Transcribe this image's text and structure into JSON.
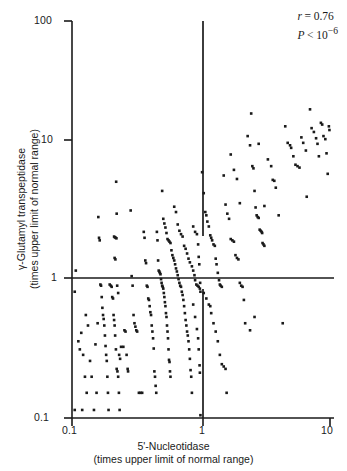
{
  "chart_data": {
    "type": "scatter",
    "title": "",
    "xlabel": "5'-Nucleotidase",
    "xlabel_sub": "(times upper limit of normal range)",
    "ylabel": "γ-Glutamyl transpeptidase",
    "ylabel_sub": "(times upper limit of normal range)",
    "xscale": "log",
    "yscale": "log",
    "xlim": [
      0.1,
      10
    ],
    "ylim": [
      0.1,
      100
    ],
    "xticks": [
      0.1,
      1,
      10
    ],
    "xtick_labels": [
      "0.1",
      "1",
      "10"
    ],
    "yticks": [
      0.1,
      1,
      10,
      100
    ],
    "ytick_labels": [
      "0.1",
      "1",
      "10",
      "100"
    ],
    "grid": false,
    "legend": null,
    "reference_lines": [
      {
        "orientation": "horizontal",
        "value": 1,
        "label": "upper limit of normal (GGT)"
      },
      {
        "orientation": "vertical",
        "value": 1,
        "label": "upper limit of normal (5'-NT)"
      }
    ],
    "annotations": {
      "r_label": "r",
      "r_value": "= 0.76",
      "p_label": "P",
      "p_value": "< 10",
      "p_exponent": "−6"
    },
    "marker": {
      "shape": "square",
      "size_px": 2.6,
      "color": "#1a1a1a"
    },
    "n_points": 280,
    "points": [
      [
        0.105,
        0.9
      ],
      [
        0.105,
        0.115
      ],
      [
        0.107,
        1.3
      ],
      [
        0.112,
        0.38
      ],
      [
        0.115,
        0.33
      ],
      [
        0.118,
        0.44
      ],
      [
        0.12,
        0.115
      ],
      [
        0.122,
        0.3
      ],
      [
        0.126,
        0.205
      ],
      [
        0.128,
        0.6
      ],
      [
        0.13,
        0.155
      ],
      [
        0.133,
        0.5
      ],
      [
        0.138,
        0.27
      ],
      [
        0.142,
        0.205
      ],
      [
        0.148,
        0.115
      ],
      [
        0.152,
        0.36
      ],
      [
        0.155,
        0.155
      ],
      [
        0.158,
        0.52
      ],
      [
        0.16,
        3.3
      ],
      [
        0.162,
        2.3
      ],
      [
        0.164,
        2.2
      ],
      [
        0.166,
        1.02
      ],
      [
        0.168,
        1.0
      ],
      [
        0.17,
        0.82
      ],
      [
        0.172,
        0.68
      ],
      [
        0.174,
        0.6
      ],
      [
        0.176,
        0.56
      ],
      [
        0.178,
        0.5
      ],
      [
        0.18,
        0.42
      ],
      [
        0.182,
        0.35
      ],
      [
        0.184,
        0.3
      ],
      [
        0.186,
        0.27
      ],
      [
        0.188,
        0.205
      ],
      [
        0.19,
        0.155
      ],
      [
        0.192,
        0.115
      ],
      [
        0.196,
        1.02
      ],
      [
        0.2,
        1.0
      ],
      [
        0.203,
        0.98
      ],
      [
        0.205,
        0.82
      ],
      [
        0.208,
        0.8
      ],
      [
        0.21,
        0.6
      ],
      [
        0.212,
        0.55
      ],
      [
        0.214,
        0.5
      ],
      [
        0.216,
        0.42
      ],
      [
        0.219,
        0.33
      ],
      [
        0.222,
        0.235
      ],
      [
        0.225,
        0.225
      ],
      [
        0.228,
        0.205
      ],
      [
        0.231,
        0.155
      ],
      [
        0.234,
        0.115
      ],
      [
        0.212,
        2.35
      ],
      [
        0.215,
        2.32
      ],
      [
        0.218,
        2.3
      ],
      [
        0.221,
        2.28
      ],
      [
        0.214,
        1.62
      ],
      [
        0.217,
        1.58
      ],
      [
        0.22,
        6.1
      ],
      [
        0.222,
        3.5
      ],
      [
        0.224,
        1.0
      ],
      [
        0.228,
        0.88
      ],
      [
        0.232,
        0.3
      ],
      [
        0.236,
        0.28
      ],
      [
        0.24,
        0.345
      ],
      [
        0.25,
        0.345
      ],
      [
        0.255,
        0.46
      ],
      [
        0.26,
        0.45
      ],
      [
        0.265,
        0.3
      ],
      [
        0.27,
        0.235
      ],
      [
        0.272,
        0.225
      ],
      [
        0.285,
        3.7
      ],
      [
        0.29,
        1.18
      ],
      [
        0.295,
        1.0
      ],
      [
        0.3,
        0.6
      ],
      [
        0.305,
        0.52
      ],
      [
        0.31,
        0.49
      ],
      [
        0.315,
        0.46
      ],
      [
        0.32,
        0.45
      ],
      [
        0.33,
        0.155
      ],
      [
        0.34,
        0.155
      ],
      [
        0.35,
        0.155
      ],
      [
        0.36,
        2.55
      ],
      [
        0.365,
        2.3
      ],
      [
        0.37,
        1.55
      ],
      [
        0.375,
        1.48
      ],
      [
        0.38,
        1.0
      ],
      [
        0.385,
        0.98
      ],
      [
        0.39,
        0.8
      ],
      [
        0.395,
        0.78
      ],
      [
        0.4,
        0.7
      ],
      [
        0.405,
        0.63
      ],
      [
        0.41,
        0.6
      ],
      [
        0.415,
        0.5
      ],
      [
        0.42,
        0.45
      ],
      [
        0.425,
        0.4
      ],
      [
        0.43,
        0.335
      ],
      [
        0.435,
        0.225
      ],
      [
        0.44,
        0.205
      ],
      [
        0.445,
        0.175
      ],
      [
        0.45,
        0.155
      ],
      [
        0.455,
        2.55
      ],
      [
        0.46,
        2.2
      ],
      [
        0.465,
        1.55
      ],
      [
        0.47,
        1.3
      ],
      [
        0.475,
        1.28
      ],
      [
        0.48,
        1.25
      ],
      [
        0.485,
        1.22
      ],
      [
        0.49,
        1.12
      ],
      [
        0.495,
        1.05
      ],
      [
        0.5,
        1.0
      ],
      [
        0.505,
        0.98
      ],
      [
        0.51,
        0.95
      ],
      [
        0.515,
        0.88
      ],
      [
        0.52,
        0.82
      ],
      [
        0.525,
        0.75
      ],
      [
        0.53,
        0.7
      ],
      [
        0.535,
        0.62
      ],
      [
        0.54,
        0.58
      ],
      [
        0.545,
        0.5
      ],
      [
        0.55,
        0.45
      ],
      [
        0.555,
        0.4
      ],
      [
        0.56,
        0.33
      ],
      [
        0.565,
        0.275
      ],
      [
        0.57,
        0.265
      ],
      [
        0.575,
        0.225
      ],
      [
        0.58,
        0.205
      ],
      [
        0.5,
        5.2
      ],
      [
        0.51,
        3.2
      ],
      [
        0.52,
        2.95
      ],
      [
        0.53,
        2.75
      ],
      [
        0.54,
        2.5
      ],
      [
        0.55,
        2.25
      ],
      [
        0.56,
        2.2
      ],
      [
        0.57,
        2.15
      ],
      [
        0.58,
        2.1
      ],
      [
        0.59,
        1.85
      ],
      [
        0.6,
        1.7
      ],
      [
        0.61,
        1.62
      ],
      [
        0.62,
        1.55
      ],
      [
        0.63,
        1.45
      ],
      [
        0.64,
        1.35
      ],
      [
        0.65,
        1.28
      ],
      [
        0.66,
        1.2
      ],
      [
        0.67,
        1.12
      ],
      [
        0.68,
        1.05
      ],
      [
        0.69,
        1.0
      ],
      [
        0.7,
        0.98
      ],
      [
        0.71,
        0.9
      ],
      [
        0.72,
        0.85
      ],
      [
        0.73,
        0.78
      ],
      [
        0.74,
        0.7
      ],
      [
        0.75,
        0.62
      ],
      [
        0.76,
        0.55
      ],
      [
        0.77,
        0.5
      ],
      [
        0.78,
        0.45
      ],
      [
        0.79,
        0.42
      ],
      [
        0.8,
        0.38
      ],
      [
        0.81,
        0.33
      ],
      [
        0.82,
        0.28
      ],
      [
        0.83,
        0.23
      ],
      [
        0.84,
        0.205
      ],
      [
        0.85,
        0.155
      ],
      [
        0.62,
        3.95
      ],
      [
        0.64,
        3.6
      ],
      [
        0.66,
        2.9
      ],
      [
        0.68,
        2.6
      ],
      [
        0.7,
        2.45
      ],
      [
        0.72,
        2.35
      ],
      [
        0.74,
        2.0
      ],
      [
        0.76,
        1.9
      ],
      [
        0.78,
        1.75
      ],
      [
        0.8,
        1.6
      ],
      [
        0.82,
        1.5
      ],
      [
        0.85,
        1.4
      ],
      [
        0.87,
        1.3
      ],
      [
        0.89,
        1.2
      ],
      [
        0.9,
        1.1
      ],
      [
        0.92,
        1.02
      ],
      [
        0.94,
        1.0
      ],
      [
        0.96,
        0.98
      ],
      [
        0.98,
        0.95
      ],
      [
        0.99,
        0.9
      ],
      [
        0.87,
        2.8
      ],
      [
        0.9,
        2.55
      ],
      [
        0.93,
        2.45
      ],
      [
        0.95,
        2.05
      ],
      [
        0.96,
        1.65
      ],
      [
        0.97,
        1.45
      ],
      [
        0.985,
        1.05
      ],
      [
        0.87,
        0.72
      ],
      [
        0.9,
        0.58
      ],
      [
        0.93,
        0.47
      ],
      [
        0.95,
        0.4
      ],
      [
        0.96,
        0.33
      ],
      [
        0.975,
        0.25
      ],
      [
        0.98,
        0.22
      ],
      [
        0.99,
        0.105
      ],
      [
        1.02,
        7.2
      ],
      [
        1.05,
        5.0
      ],
      [
        1.08,
        3.6
      ],
      [
        1.1,
        3.4
      ],
      [
        1.12,
        3.05
      ],
      [
        1.15,
        2.8
      ],
      [
        1.18,
        2.4
      ],
      [
        1.2,
        2.3
      ],
      [
        1.22,
        2.2
      ],
      [
        1.25,
        2.05
      ],
      [
        1.28,
        2.0
      ],
      [
        1.3,
        1.6
      ],
      [
        1.32,
        1.45
      ],
      [
        1.35,
        1.25
      ],
      [
        1.38,
        1.1
      ],
      [
        1.4,
        1.02
      ],
      [
        1.42,
        1.0
      ],
      [
        1.45,
        0.98
      ],
      [
        1.05,
        0.88
      ],
      [
        1.1,
        0.8
      ],
      [
        1.15,
        0.72
      ],
      [
        1.18,
        0.7
      ],
      [
        1.2,
        0.62
      ],
      [
        1.25,
        0.52
      ],
      [
        1.3,
        0.45
      ],
      [
        1.35,
        0.38
      ],
      [
        1.4,
        0.3
      ],
      [
        1.45,
        0.255
      ],
      [
        1.5,
        0.245
      ],
      [
        1.55,
        0.235
      ],
      [
        1.58,
        0.155
      ],
      [
        1.5,
        6.8
      ],
      [
        1.55,
        4.1
      ],
      [
        1.6,
        3.5
      ],
      [
        1.65,
        3.2
      ],
      [
        1.7,
        2.25
      ],
      [
        1.75,
        2.2
      ],
      [
        1.8,
        2.15
      ],
      [
        1.85,
        1.7
      ],
      [
        1.9,
        1.62
      ],
      [
        1.95,
        1.58
      ],
      [
        2.0,
        1.05
      ],
      [
        2.05,
        1.0
      ],
      [
        2.1,
        0.98
      ],
      [
        2.15,
        0.78
      ],
      [
        1.7,
        9.8
      ],
      [
        1.8,
        7.5
      ],
      [
        1.9,
        6.4
      ],
      [
        2.0,
        4.2
      ],
      [
        2.2,
        0.52
      ],
      [
        2.4,
        0.46
      ],
      [
        2.6,
        0.58
      ],
      [
        2.3,
        13.5
      ],
      [
        2.4,
        11.5
      ],
      [
        2.5,
        8.0
      ],
      [
        2.55,
        7.7
      ],
      [
        2.6,
        5.2
      ],
      [
        2.65,
        3.9
      ],
      [
        2.7,
        3.4
      ],
      [
        2.75,
        3.3
      ],
      [
        2.8,
        3.25
      ],
      [
        2.85,
        2.65
      ],
      [
        2.9,
        2.6
      ],
      [
        2.95,
        2.55
      ],
      [
        2.98,
        2.5
      ],
      [
        3.0,
        2.1
      ],
      [
        3.05,
        2.05
      ],
      [
        3.1,
        2.0
      ],
      [
        2.45,
        20.0
      ],
      [
        2.8,
        11.8
      ],
      [
        3.1,
        4.0
      ],
      [
        3.3,
        9.0
      ],
      [
        3.5,
        8.0
      ],
      [
        3.6,
        6.3
      ],
      [
        3.7,
        6.2
      ],
      [
        3.8,
        5.5
      ],
      [
        4.0,
        3.4
      ],
      [
        4.3,
        0.52
      ],
      [
        4.5,
        16.0
      ],
      [
        4.7,
        12.0
      ],
      [
        4.9,
        11.5
      ],
      [
        5.0,
        11.0
      ],
      [
        5.2,
        9.5
      ],
      [
        5.4,
        8.2
      ],
      [
        5.6,
        8.0
      ],
      [
        5.8,
        7.8
      ],
      [
        6.0,
        13.2
      ],
      [
        6.2,
        12.0
      ],
      [
        6.5,
        10.5
      ],
      [
        6.6,
        4.7
      ],
      [
        7.0,
        21.5
      ],
      [
        7.2,
        15.5
      ],
      [
        7.5,
        14.5
      ],
      [
        7.8,
        13.0
      ],
      [
        8.0,
        11.8
      ],
      [
        8.2,
        9.5
      ],
      [
        8.5,
        17.0
      ],
      [
        8.7,
        16.5
      ],
      [
        8.9,
        13.5
      ],
      [
        9.2,
        12.8
      ],
      [
        9.4,
        10.0
      ],
      [
        9.6,
        7.0
      ],
      [
        9.8,
        16.0
      ],
      [
        9.9,
        15.0
      ]
    ]
  }
}
